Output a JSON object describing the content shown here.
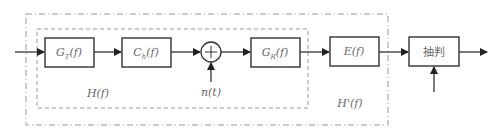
{
  "diagram": {
    "type": "block-diagram",
    "blocks": [
      {
        "id": "gt",
        "label_main": "G",
        "label_sub": "T",
        "label_arg": "(f)"
      },
      {
        "id": "ch",
        "label_main": "C",
        "label_sub": "h",
        "label_arg": "(f)"
      },
      {
        "id": "gr",
        "label_main": "G",
        "label_sub": "R",
        "label_arg": "(f)"
      },
      {
        "id": "e",
        "label_main": "E",
        "label_sub": "",
        "label_arg": "(f)"
      },
      {
        "id": "decision",
        "label_main": "抽判",
        "label_sub": "",
        "label_arg": ""
      }
    ],
    "summing_junction": {
      "symbol": "+",
      "noise_label": "n(t)"
    },
    "groups": {
      "inner": {
        "label": "H(f)",
        "style": "dashed"
      },
      "outer": {
        "label": "H'(f)",
        "style": "dash-dot"
      }
    },
    "colors": {
      "stroke": "#333333",
      "group_stroke": "#888888",
      "text": "#666666"
    }
  }
}
